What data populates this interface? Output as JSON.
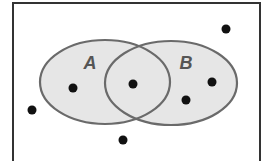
{
  "diagram": {
    "type": "venn",
    "universe": {
      "x": 13,
      "y": 3,
      "width": 247,
      "height": 160,
      "stroke": "#333333"
    },
    "sets": [
      {
        "label": "A",
        "cx": 105,
        "cy": 82,
        "rx": 65,
        "ry": 42,
        "label_x": 90,
        "label_y": 69,
        "fill": "#e6e6e6",
        "stroke": "#6a6a6a",
        "label_color": "#555555"
      },
      {
        "label": "B",
        "cx": 171,
        "cy": 83,
        "rx": 66,
        "ry": 42,
        "label_x": 186,
        "label_y": 69,
        "fill": "#e6e6e6",
        "stroke": "#6a6a6a",
        "label_color": "#555555"
      }
    ],
    "points": [
      {
        "region": "outside",
        "x": 226,
        "y": 29
      },
      {
        "region": "A only",
        "x": 73,
        "y": 88
      },
      {
        "region": "A and B",
        "x": 133,
        "y": 84
      },
      {
        "region": "B only",
        "x": 212,
        "y": 82
      },
      {
        "region": "B only",
        "x": 186,
        "y": 100
      },
      {
        "region": "outside",
        "x": 32,
        "y": 110
      },
      {
        "region": "outside",
        "x": 123,
        "y": 140
      }
    ],
    "point_color": "#111111",
    "point_radius": 4.5
  }
}
